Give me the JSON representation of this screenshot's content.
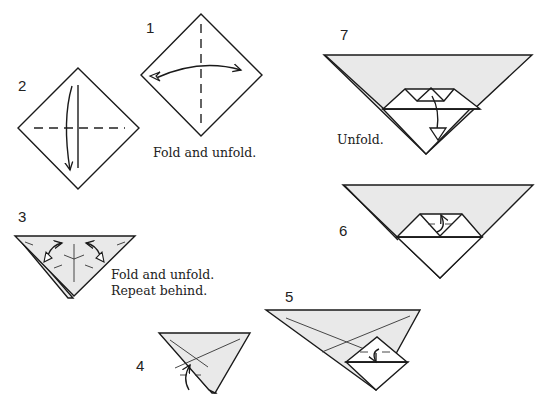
{
  "diagram": {
    "type": "origami-instructions",
    "fill_color": "#e9e9e9",
    "line_color": "#1a1a1a",
    "steps": [
      {
        "number": "1",
        "caption": "Fold and unfold."
      },
      {
        "number": "2",
        "caption": ""
      },
      {
        "number": "3",
        "caption_line1": "Fold and unfold.",
        "caption_line2": "Repeat behind."
      },
      {
        "number": "4",
        "caption": ""
      },
      {
        "number": "5",
        "caption": ""
      },
      {
        "number": "6",
        "caption": ""
      },
      {
        "number": "7",
        "caption": "Unfold."
      }
    ]
  }
}
